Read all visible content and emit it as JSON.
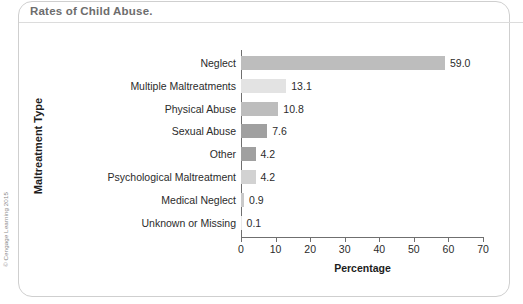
{
  "panel": {
    "title": "Rates of Child Abuse.",
    "credit": "© Cengage Learning 2015",
    "border_color": "#cfcfcf"
  },
  "chart_data": {
    "type": "bar",
    "orientation": "horizontal",
    "title": "Rates of Child Abuse.",
    "xlabel": "Percentage",
    "ylabel": "Maltreatment Type",
    "xlim": [
      0,
      70
    ],
    "xticks": [
      0,
      10,
      20,
      30,
      40,
      50,
      60,
      70
    ],
    "grid": false,
    "legend": null,
    "categories": [
      "Neglect",
      "Multiple Maltreatments",
      "Physical Abuse",
      "Sexual Abuse",
      "Other",
      "Psychological Maltreatment",
      "Medical Neglect",
      "Unknown or Missing"
    ],
    "values": [
      59.0,
      13.1,
      10.8,
      7.6,
      4.2,
      4.2,
      0.9,
      0.1
    ],
    "value_labels": [
      "59.0",
      "13.1",
      "10.8",
      "7.6",
      "4.2",
      "4.2",
      "0.9",
      "0.1"
    ],
    "bar_colors": [
      "#bdbdbd",
      "#e3e3e3",
      "#bdbdbd",
      "#a0a0a0",
      "#a0a0a0",
      "#d2d2d2",
      "#c9c9c9",
      "#e8e8e8"
    ]
  }
}
